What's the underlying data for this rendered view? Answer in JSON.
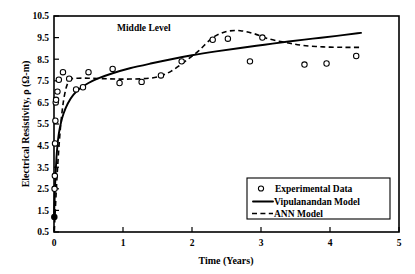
{
  "chart_data": {
    "type": "scatter",
    "title": "",
    "annotation": "Middle Level",
    "xlabel": "Time (Years)",
    "ylabel": "Electrical Resistivity, ρ (Ω-m)",
    "xlim": [
      0,
      5
    ],
    "ylim": [
      0.5,
      10.5
    ],
    "xticks": [
      "0",
      "1",
      "2",
      "3",
      "4",
      "5"
    ],
    "xtick_values": [
      0,
      1,
      2,
      3,
      4,
      5
    ],
    "yticks": [
      "0.5",
      "1.5",
      "2.5",
      "3.5",
      "4.5",
      "5.5",
      "6.5",
      "7.5",
      "8.5",
      "9.5",
      "10.5"
    ],
    "ytick_values": [
      0.5,
      1.5,
      2.5,
      3.5,
      4.5,
      5.5,
      6.5,
      7.5,
      8.5,
      9.5,
      10.5
    ],
    "grid": false,
    "legend_position": "lower right",
    "legend": [
      {
        "label": "Experimental Data",
        "marker": "open-circle"
      },
      {
        "label": "Vipulanandan Model",
        "marker": "solid-line"
      },
      {
        "label": "ANN Model",
        "marker": "dashed-line"
      }
    ],
    "series": [
      {
        "name": "Experimental Data",
        "type": "scatter",
        "marker": "open-circle",
        "points": [
          [
            0.005,
            1.2
          ],
          [
            0.008,
            2.5
          ],
          [
            0.012,
            3.1
          ],
          [
            0.015,
            4.6
          ],
          [
            0.02,
            5.65
          ],
          [
            0.025,
            6.5
          ],
          [
            0.03,
            6.62
          ],
          [
            0.05,
            7.0
          ],
          [
            0.07,
            7.55
          ],
          [
            0.13,
            7.9
          ],
          [
            0.22,
            7.6
          ],
          [
            0.32,
            7.1
          ],
          [
            0.42,
            7.2
          ],
          [
            0.5,
            7.9
          ],
          [
            0.85,
            8.05
          ],
          [
            0.95,
            7.4
          ],
          [
            1.27,
            7.45
          ],
          [
            1.55,
            7.75
          ],
          [
            1.85,
            8.4
          ],
          [
            2.3,
            9.4
          ],
          [
            2.52,
            9.45
          ],
          [
            2.84,
            8.4
          ],
          [
            3.02,
            9.5
          ],
          [
            3.63,
            8.25
          ],
          [
            3.95,
            8.3
          ],
          [
            4.38,
            8.65
          ]
        ]
      },
      {
        "name": "Vipulanandan Model",
        "type": "line",
        "style": "solid",
        "points": [
          [
            0.0,
            1.2
          ],
          [
            0.01,
            2.1
          ],
          [
            0.02,
            3.0
          ],
          [
            0.035,
            3.9
          ],
          [
            0.05,
            4.5
          ],
          [
            0.07,
            5.05
          ],
          [
            0.1,
            5.55
          ],
          [
            0.14,
            6.0
          ],
          [
            0.2,
            6.45
          ],
          [
            0.28,
            6.85
          ],
          [
            0.38,
            7.15
          ],
          [
            0.5,
            7.4
          ],
          [
            0.65,
            7.62
          ],
          [
            0.85,
            7.85
          ],
          [
            1.1,
            8.08
          ],
          [
            1.4,
            8.3
          ],
          [
            1.7,
            8.5
          ],
          [
            2.0,
            8.68
          ],
          [
            2.35,
            8.86
          ],
          [
            2.7,
            9.02
          ],
          [
            3.05,
            9.17
          ],
          [
            3.4,
            9.32
          ],
          [
            3.75,
            9.45
          ],
          [
            4.1,
            9.58
          ],
          [
            4.4,
            9.7
          ],
          [
            4.45,
            9.72
          ]
        ]
      },
      {
        "name": "ANN Model",
        "type": "line",
        "style": "dashed",
        "points": [
          [
            0.005,
            0.55
          ],
          [
            0.02,
            1.6
          ],
          [
            0.05,
            3.4
          ],
          [
            0.09,
            5.2
          ],
          [
            0.13,
            6.4
          ],
          [
            0.17,
            7.1
          ],
          [
            0.21,
            7.45
          ],
          [
            0.26,
            7.6
          ],
          [
            0.35,
            7.62
          ],
          [
            0.5,
            7.62
          ],
          [
            0.7,
            7.6
          ],
          [
            0.9,
            7.58
          ],
          [
            1.1,
            7.58
          ],
          [
            1.3,
            7.6
          ],
          [
            1.5,
            7.68
          ],
          [
            1.7,
            7.95
          ],
          [
            1.9,
            8.4
          ],
          [
            2.1,
            8.9
          ],
          [
            2.3,
            9.5
          ],
          [
            2.5,
            9.78
          ],
          [
            2.7,
            9.82
          ],
          [
            2.9,
            9.68
          ],
          [
            3.1,
            9.45
          ],
          [
            3.35,
            9.28
          ],
          [
            3.6,
            9.14
          ],
          [
            3.9,
            9.07
          ],
          [
            4.2,
            9.05
          ],
          [
            4.45,
            9.05
          ]
        ]
      }
    ]
  },
  "axes": {
    "x_title": "Time (Years)",
    "y_title": "Electrical Resistivity, ρ (Ω-m)"
  },
  "annotation": {
    "middle_level": "Middle Level"
  },
  "legend": {
    "item_1": "Experimental Data",
    "item_2": "Vipulanandan Model",
    "item_3": "ANN Model"
  },
  "colors": {
    "foreground": "#000000",
    "background": "#ffffff"
  }
}
